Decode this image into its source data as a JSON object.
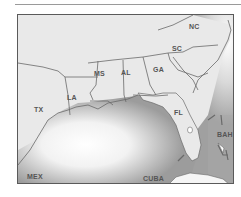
{
  "map": {
    "type": "regional map",
    "region": "Southeastern United States and Gulf of Mexico",
    "colors": {
      "land": "#e9e9e9",
      "water_dark": "#9c9c9c",
      "water_light": "#ffffff",
      "borders": "#6a6a6a",
      "frame": "#5a5a5a",
      "label": "#555555"
    },
    "labels": {
      "nc": "NC",
      "sc": "SC",
      "ga": "GA",
      "al": "AL",
      "ms": "MS",
      "la": "LA",
      "tx": "TX",
      "fl": "FL",
      "bah": "BAH",
      "mex": "MEX",
      "cuba": "CUBA"
    },
    "states": [
      "NC",
      "SC",
      "GA",
      "AL",
      "MS",
      "LA",
      "TX",
      "FL"
    ],
    "countries": [
      "BAH",
      "MEX",
      "CUBA"
    ]
  }
}
